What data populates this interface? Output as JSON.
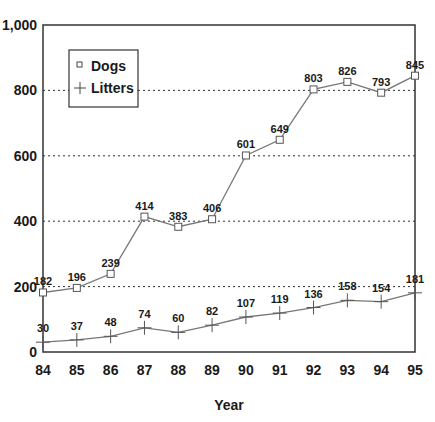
{
  "chart_data": {
    "type": "line",
    "title": "",
    "xlabel": "Year",
    "ylabel": "",
    "categories": [
      "84",
      "85",
      "86",
      "87",
      "88",
      "89",
      "90",
      "91",
      "92",
      "93",
      "94",
      "95"
    ],
    "series": [
      {
        "name": "Dogs",
        "marker": "square",
        "values": [
          182,
          196,
          239,
          414,
          383,
          406,
          601,
          649,
          803,
          826,
          793,
          845
        ],
        "labels": [
          "182",
          "196",
          "239",
          "414",
          "383",
          "406",
          "601",
          "649",
          "803",
          "826",
          "793",
          "845"
        ]
      },
      {
        "name": "Litters",
        "marker": "plus",
        "values": [
          30,
          37,
          48,
          74,
          60,
          82,
          107,
          119,
          136,
          158,
          154,
          181
        ],
        "labels": [
          "30",
          "37",
          "48",
          "74",
          "60",
          "82",
          "107",
          "119",
          "136",
          "158",
          "154",
          "181"
        ]
      }
    ],
    "ylim": [
      0,
      1000
    ],
    "yticks": [
      0,
      200,
      400,
      600,
      800,
      1000
    ],
    "ytick_labels": [
      "0",
      "200",
      "400",
      "600",
      "800",
      "1,000"
    ],
    "grid": {
      "horizontal": true,
      "style": "dotted",
      "at": [
        200,
        400,
        600,
        800
      ]
    },
    "legend": {
      "position": "upper-left, inside plot",
      "entries": [
        "Dogs",
        "Litters"
      ]
    },
    "colors": {
      "line": "#777777",
      "axis": "#333333",
      "text": "#1a1a1a",
      "grid": "#333333"
    }
  }
}
